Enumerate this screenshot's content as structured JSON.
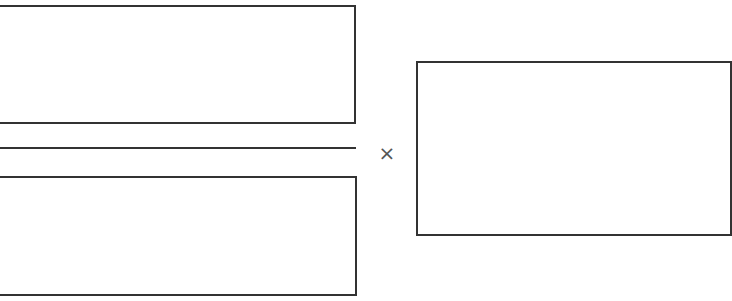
{
  "diagram": {
    "numerator_box": {
      "label": ""
    },
    "fraction_bar": {
      "label": ""
    },
    "denominator_box": {
      "label": ""
    },
    "operator": {
      "symbol": "×",
      "name": "multiply"
    },
    "multiplier_box": {
      "label": ""
    }
  },
  "colors": {
    "stroke": "#333333",
    "operator": "#555555",
    "background": "#ffffff"
  }
}
